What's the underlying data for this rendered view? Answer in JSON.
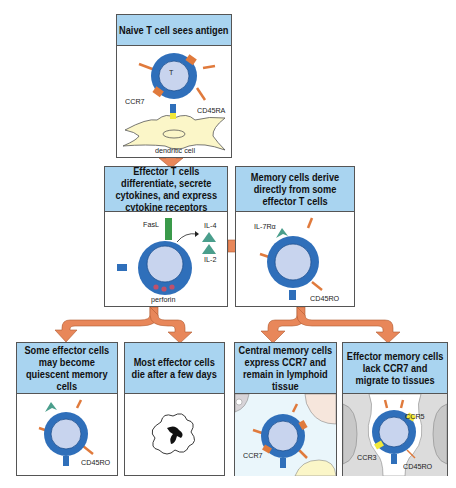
{
  "boxes": {
    "naive": {
      "title": "Naive T cell sees antigen",
      "labels": {
        "t": "T",
        "ccr7": "CCR7",
        "cd45ra": "CD45RA",
        "dendritic": "dendritic cell"
      }
    },
    "effector": {
      "title": "Effector T cells differentiate, secrete cytokines, and express cytokine receptors",
      "labels": {
        "fasl": "FasL",
        "il4": "IL-4",
        "il2": "IL-2",
        "perforin": "perforin"
      }
    },
    "memory_derive": {
      "title": "Memory cells derive directly from some effector T cells",
      "labels": {
        "il7ra": "IL-7Rα",
        "cd45ro": "CD45RO"
      }
    },
    "quiescent": {
      "title": "Some effector cells may become quiescent memory cells",
      "labels": {
        "cd45ro": "CD45RO"
      }
    },
    "die": {
      "title": "Most effector cells die after a few days"
    },
    "central": {
      "title": "Central memory cells express CCR7 and remain in lymphoid tissue",
      "labels": {
        "ccr7": "CCR7"
      }
    },
    "effector_memory": {
      "title": "Effector memory cells lack CCR7 and migrate to tissues",
      "labels": {
        "ccr5": "CCR5",
        "ccr3": "CCR3",
        "cd45ro": "CD45RO"
      }
    }
  },
  "colors": {
    "header": "#a9d4f0",
    "arrow": "#e8875a",
    "cell_outer": "#2f6fba",
    "cell_inner": "#c8d4ee",
    "receptor": "#e07a3c",
    "dendritic": "#fbf6c8",
    "il_triangle": "#4a9e8c",
    "fasl": "#3a9a4a",
    "ccr5": "#f2e83a"
  }
}
